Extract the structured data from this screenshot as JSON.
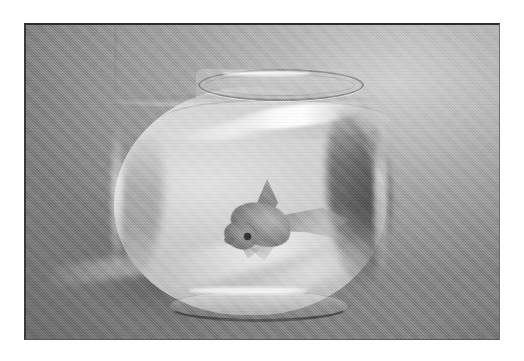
{
  "image": {
    "kind": "photograph",
    "medium": "black-and-white halftone print",
    "orientation": "landscape",
    "alt_text": "Black and white photograph of a single goldfish swimming in a round glass fishbowl filled with water, resting on a light surface against a plain studio backdrop",
    "caption": "",
    "subject": "goldfish in a glass fishbowl",
    "frame": {
      "has_border": true,
      "border_color": "#2b2b2b",
      "outer_background": "#ffffff"
    },
    "palette": {
      "backdrop_light": "#c8c8c8",
      "backdrop_mid": "#b4b4b4",
      "backdrop_dark": "#9c9c9c",
      "water_gray": "#c6c6c6",
      "glass_highlight": "#ffffff",
      "refraction_dark": "#4a4a4a",
      "fish_body": "#8e8e8e",
      "fish_eye": "#2f2f2f",
      "shadow": "#6e6e6e"
    },
    "objects": [
      {
        "name": "fishbowl",
        "description": "round glass bowl with a narrow neck and flared circular rim, about two-thirds full of water",
        "position": "center"
      },
      {
        "name": "goldfish",
        "description": "one fish with raised dorsal fin and long flowing tail, head angled down and to the left, dark round eye",
        "position": "center-left inside the bowl"
      },
      {
        "name": "water-surface",
        "description": "flat waterline with a visible meniscus across the bowl",
        "position": "upper third of the bowl"
      },
      {
        "name": "refraction-band",
        "description": "dark crescent of refracted light hugging the right inner wall of the bowl",
        "position": "right side of the bowl"
      },
      {
        "name": "cast-shadow",
        "description": "soft shadow spreading to the lower left of the bowl across the table surface",
        "position": "lower left"
      },
      {
        "name": "rim-highlight",
        "description": "bright specular streak along the glass just below the rim",
        "position": "upper center"
      }
    ]
  }
}
